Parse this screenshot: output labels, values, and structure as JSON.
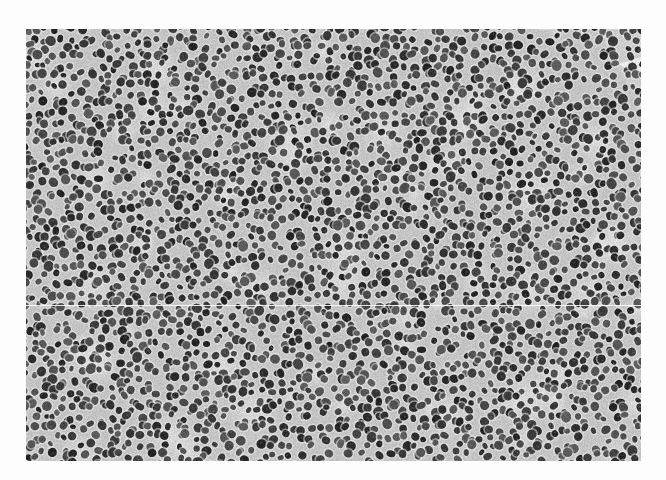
{
  "image": {
    "subject": "histology micrograph",
    "description": "Densely packed small round cell nuclei in grayscale tissue section",
    "palette": {
      "background": "#c4c4c4",
      "stroma_light": "#dcdcdc",
      "nucleus_dark": "#2e2e2e",
      "nucleus_mid": "#555555",
      "halo": "#e6e6e6",
      "page": "#fdfdfd",
      "scan_line": "#ffffff"
    }
  },
  "caption": {
    "text": ""
  }
}
